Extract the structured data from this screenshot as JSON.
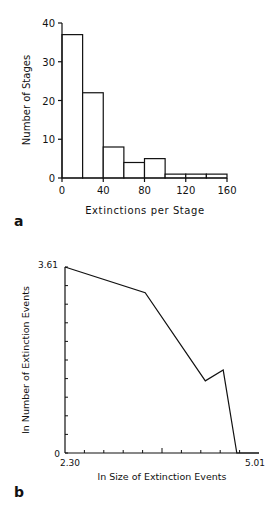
{
  "panels": {
    "a": {
      "label": "a"
    },
    "b": {
      "label": "b"
    }
  },
  "chart_data": [
    {
      "type": "bar",
      "panel": "a",
      "title": "",
      "xlabel": "Extinctions per Stage",
      "ylabel": "Number of Stages",
      "bin_edges": [
        0,
        20,
        40,
        60,
        80,
        100,
        120,
        140,
        160
      ],
      "categories": [
        "0-20",
        "20-40",
        "40-60",
        "60-80",
        "80-100",
        "100-120",
        "120-140",
        "140-160"
      ],
      "values": [
        37,
        22,
        8,
        4,
        5,
        1,
        1,
        1
      ],
      "xlim": [
        0,
        160
      ],
      "ylim": [
        0,
        40
      ],
      "xticks": [
        "0",
        "40",
        "80",
        "120",
        "160"
      ],
      "yticks": [
        "0",
        "10",
        "20",
        "30",
        "40"
      ],
      "grid": false
    },
    {
      "type": "line",
      "panel": "b",
      "title": "",
      "xlabel": "ln Size of Extinction Events",
      "ylabel": "ln Number of Extinction Events",
      "x": [
        2.3,
        3.42,
        4.26,
        4.51,
        4.7,
        5.01
      ],
      "y": [
        3.61,
        3.11,
        1.4,
        1.61,
        0,
        0
      ],
      "xlim": [
        2.3,
        5.01
      ],
      "ylim": [
        0,
        3.61
      ],
      "xticks": [
        "2.30",
        "5.01"
      ],
      "yticks": [
        "0",
        "3.61"
      ],
      "grid": false
    }
  ]
}
